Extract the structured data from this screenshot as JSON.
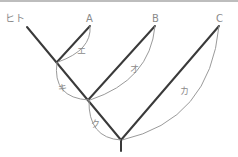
{
  "diagram": {
    "type": "phylogenetic-tree",
    "taxa": [
      {
        "id": "human",
        "label": "ヒト"
      },
      {
        "id": "A",
        "label": "A"
      },
      {
        "id": "B",
        "label": "B"
      },
      {
        "id": "C",
        "label": "C"
      }
    ],
    "branch_labels": [
      {
        "id": "e",
        "label": "エ"
      },
      {
        "id": "o",
        "label": "オ"
      },
      {
        "id": "ki",
        "label": "キ"
      },
      {
        "id": "ku",
        "label": "ク"
      },
      {
        "id": "ka",
        "label": "カ"
      }
    ],
    "colors": {
      "branch": "#3a3a3a",
      "arc": "#9a9a9a",
      "text": "#8a8a8a"
    }
  }
}
